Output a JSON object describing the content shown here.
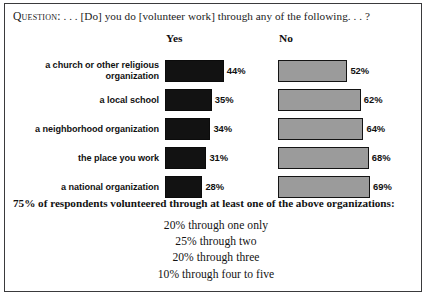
{
  "question": {
    "keyword": "Question:",
    "text": " . . . [Do] you do [volunteer work] through any of the following. . . ?"
  },
  "headers": {
    "yes": "Yes",
    "no": "No"
  },
  "footer": {
    "summary": "75% of respondents volunteered through at least one of the above organizations:",
    "lines": [
      "20% through one only",
      "25% through two",
      "20% through three",
      "10% through four to five"
    ]
  },
  "chart_data": {
    "type": "bar",
    "orientation": "horizontal",
    "title": "Question: . . . [Do] you do [volunteer work] through any of the following. . . ?",
    "xlabel": "",
    "ylabel": "",
    "grid": false,
    "legend_position": "top",
    "categories": [
      "a church or other religious organization",
      "a local school",
      "a neighborhood organization",
      "the place you work",
      "a national organization"
    ],
    "series": [
      {
        "name": "Yes",
        "color": "#121212",
        "values": [
          44,
          35,
          34,
          31,
          28
        ],
        "labels": [
          "44%",
          "35%",
          "34%",
          "31%",
          "28%"
        ]
      },
      {
        "name": "No",
        "color": "#9b9b9b",
        "values": [
          52,
          62,
          64,
          68,
          69
        ],
        "labels": [
          "52%",
          "62%",
          "64%",
          "68%",
          "69%"
        ]
      }
    ]
  }
}
